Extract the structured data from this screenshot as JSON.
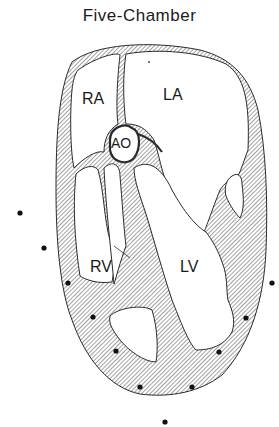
{
  "title": "Five-Chamber",
  "chambers": {
    "ra": "RA",
    "la": "LA",
    "ao": "AO",
    "rv": "RV",
    "lv": "LV"
  },
  "colors": {
    "line": "#2a2a2a",
    "hatch_fill": "#cfcfcf",
    "dot": "#111111",
    "background": "#ffffff"
  },
  "segment_dots": [
    {
      "x": 20,
      "y": 213
    },
    {
      "x": 44,
      "y": 248
    },
    {
      "x": 68,
      "y": 283
    },
    {
      "x": 93,
      "y": 317
    },
    {
      "x": 116,
      "y": 351
    },
    {
      "x": 140,
      "y": 387
    },
    {
      "x": 165,
      "y": 422
    },
    {
      "x": 192,
      "y": 387
    },
    {
      "x": 219,
      "y": 352
    },
    {
      "x": 246,
      "y": 318
    },
    {
      "x": 272,
      "y": 283
    }
  ]
}
